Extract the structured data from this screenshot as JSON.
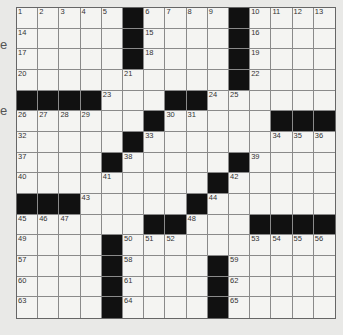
{
  "edge_fragments": [
    {
      "text": "e",
      "top": 38
    },
    {
      "text": "e",
      "top": 104
    }
  ],
  "puzzle": {
    "rows": 15,
    "cols": 15,
    "grid": [
      "......#....#....",
      "....."
    ],
    "black_cells": [
      [
        1,
        6
      ],
      [
        1,
        11
      ],
      [
        2,
        6
      ],
      [
        2,
        11
      ],
      [
        3,
        6
      ],
      [
        3,
        11
      ],
      [
        4,
        11
      ],
      [
        5,
        1
      ],
      [
        5,
        2
      ],
      [
        5,
        3
      ],
      [
        5,
        4
      ],
      [
        5,
        8
      ],
      [
        5,
        9
      ],
      [
        6,
        7
      ],
      [
        6,
        13
      ],
      [
        6,
        14
      ],
      [
        6,
        15
      ],
      [
        7,
        6
      ],
      [
        8,
        5
      ],
      [
        8,
        11
      ],
      [
        9,
        10
      ],
      [
        10,
        1
      ],
      [
        10,
        2
      ],
      [
        10,
        3
      ],
      [
        10,
        9
      ],
      [
        11,
        7
      ],
      [
        11,
        8
      ],
      [
        11,
        12
      ],
      [
        11,
        13
      ],
      [
        11,
        14
      ],
      [
        11,
        15
      ],
      [
        12,
        5
      ],
      [
        13,
        5
      ],
      [
        13,
        10
      ],
      [
        14,
        5
      ],
      [
        14,
        10
      ],
      [
        15,
        5
      ],
      [
        15,
        10
      ]
    ],
    "numbers": [
      {
        "r": 1,
        "c": 1,
        "n": "1"
      },
      {
        "r": 1,
        "c": 2,
        "n": "2"
      },
      {
        "r": 1,
        "c": 3,
        "n": "3"
      },
      {
        "r": 1,
        "c": 4,
        "n": "4"
      },
      {
        "r": 1,
        "c": 5,
        "n": "5"
      },
      {
        "r": 1,
        "c": 7,
        "n": "6"
      },
      {
        "r": 1,
        "c": 8,
        "n": "7"
      },
      {
        "r": 1,
        "c": 9,
        "n": "8"
      },
      {
        "r": 1,
        "c": 10,
        "n": "9"
      },
      {
        "r": 1,
        "c": 12,
        "n": "10"
      },
      {
        "r": 1,
        "c": 13,
        "n": "11"
      },
      {
        "r": 1,
        "c": 14,
        "n": "12"
      },
      {
        "r": 1,
        "c": 15,
        "n": "13"
      },
      {
        "r": 2,
        "c": 1,
        "n": "14"
      },
      {
        "r": 2,
        "c": 7,
        "n": "15"
      },
      {
        "r": 2,
        "c": 12,
        "n": "16"
      },
      {
        "r": 3,
        "c": 1,
        "n": "17"
      },
      {
        "r": 3,
        "c": 7,
        "n": "18"
      },
      {
        "r": 3,
        "c": 12,
        "n": "19"
      },
      {
        "r": 4,
        "c": 1,
        "n": "20"
      },
      {
        "r": 4,
        "c": 6,
        "n": "21"
      },
      {
        "r": 4,
        "c": 12,
        "n": "22"
      },
      {
        "r": 5,
        "c": 5,
        "n": "23"
      },
      {
        "r": 5,
        "c": 10,
        "n": "24"
      },
      {
        "r": 5,
        "c": 11,
        "n": "25"
      },
      {
        "r": 6,
        "c": 1,
        "n": "26"
      },
      {
        "r": 6,
        "c": 2,
        "n": "27"
      },
      {
        "r": 6,
        "c": 3,
        "n": "28"
      },
      {
        "r": 6,
        "c": 4,
        "n": "29"
      },
      {
        "r": 6,
        "c": 8,
        "n": "30"
      },
      {
        "r": 6,
        "c": 9,
        "n": "31"
      },
      {
        "r": 7,
        "c": 1,
        "n": "32"
      },
      {
        "r": 7,
        "c": 7,
        "n": "33"
      },
      {
        "r": 7,
        "c": 13,
        "n": "34"
      },
      {
        "r": 7,
        "c": 14,
        "n": "35"
      },
      {
        "r": 7,
        "c": 15,
        "n": "36"
      },
      {
        "r": 8,
        "c": 1,
        "n": "37"
      },
      {
        "r": 8,
        "c": 6,
        "n": "38"
      },
      {
        "r": 8,
        "c": 12,
        "n": "39"
      },
      {
        "r": 9,
        "c": 1,
        "n": "40"
      },
      {
        "r": 9,
        "c": 5,
        "n": "41"
      },
      {
        "r": 9,
        "c": 11,
        "n": "42"
      },
      {
        "r": 10,
        "c": 4,
        "n": "43"
      },
      {
        "r": 10,
        "c": 10,
        "n": "44"
      },
      {
        "r": 11,
        "c": 1,
        "n": "45"
      },
      {
        "r": 11,
        "c": 2,
        "n": "46"
      },
      {
        "r": 11,
        "c": 3,
        "n": "47"
      },
      {
        "r": 11,
        "c": 9,
        "n": "48"
      },
      {
        "r": 12,
        "c": 1,
        "n": "49"
      },
      {
        "r": 12,
        "c": 6,
        "n": "50"
      },
      {
        "r": 12,
        "c": 7,
        "n": "51"
      },
      {
        "r": 12,
        "c": 8,
        "n": "52"
      },
      {
        "r": 12,
        "c": 12,
        "n": "53"
      },
      {
        "r": 12,
        "c": 13,
        "n": "54"
      },
      {
        "r": 12,
        "c": 14,
        "n": "55"
      },
      {
        "r": 12,
        "c": 15,
        "n": "56"
      },
      {
        "r": 13,
        "c": 1,
        "n": "57"
      },
      {
        "r": 13,
        "c": 6,
        "n": "58"
      },
      {
        "r": 13,
        "c": 11,
        "n": "59"
      },
      {
        "r": 14,
        "c": 1,
        "n": "60"
      },
      {
        "r": 14,
        "c": 6,
        "n": "61"
      },
      {
        "r": 14,
        "c": 11,
        "n": "62"
      },
      {
        "r": 15,
        "c": 1,
        "n": "63"
      },
      {
        "r": 15,
        "c": 6,
        "n": "64"
      },
      {
        "r": 15,
        "c": 11,
        "n": "65"
      }
    ]
  },
  "colors": {
    "black_cell": "#111111",
    "white_cell": "#f4f4f2",
    "page": "#e9e9e7",
    "grid_line": "#8a8a8a"
  }
}
